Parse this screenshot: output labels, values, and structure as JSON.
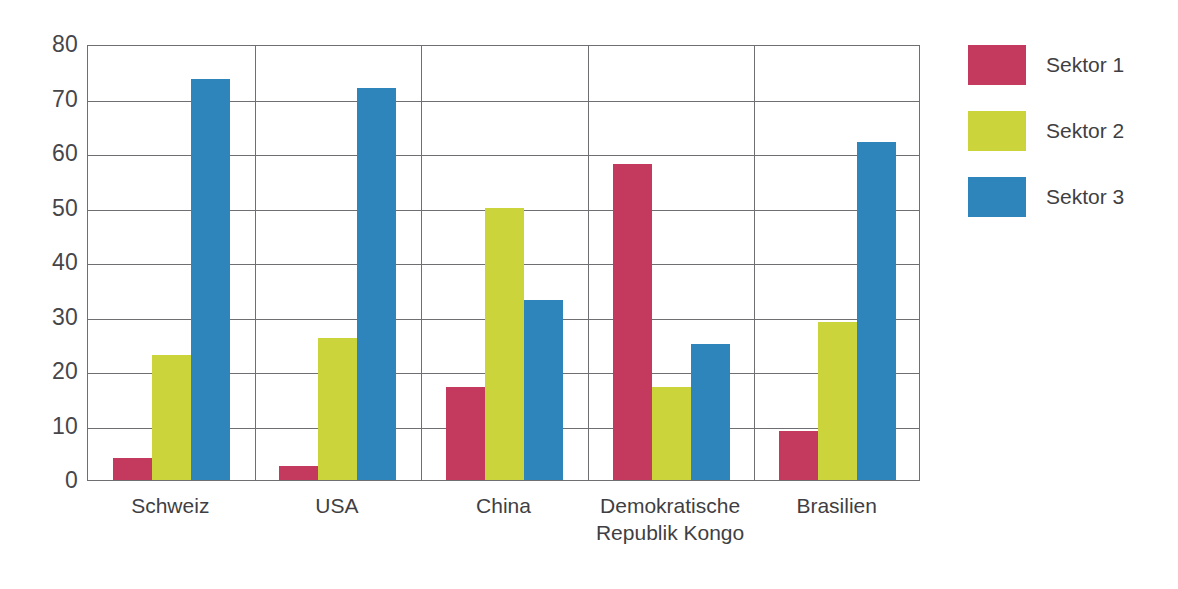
{
  "chart_data": {
    "type": "bar",
    "title": "",
    "subtitle": "",
    "xlabel": "",
    "ylabel": "",
    "ylim": [
      0,
      80
    ],
    "yticks": [
      0,
      10,
      20,
      30,
      40,
      50,
      60,
      70,
      80
    ],
    "ytick_labels": [
      "0",
      "10",
      "20",
      "30",
      "40",
      "50",
      "60",
      "70",
      "80"
    ],
    "grid": "horizontal-and-group-dividers",
    "legend_position": "right",
    "categories": [
      "Schweiz",
      "USA",
      "China",
      "Demokratische Republik Kongo",
      "Brasilien"
    ],
    "category_label_lines": [
      [
        "Schweiz"
      ],
      [
        "USA"
      ],
      [
        "China"
      ],
      [
        "Demokratische",
        "Republik Kongo"
      ],
      [
        "Brasilien"
      ]
    ],
    "series": [
      {
        "name": "Sektor 1",
        "color": "#c43a5e",
        "values": [
          4,
          2.5,
          17,
          58,
          9
        ]
      },
      {
        "name": "Sektor 2",
        "color": "#ccd43c",
        "values": [
          23,
          26,
          50,
          17,
          29
        ]
      },
      {
        "name": "Sektor 3",
        "color": "#2e85bb",
        "values": [
          73.5,
          72,
          33,
          25,
          62
        ]
      }
    ]
  },
  "legend": {
    "items": [
      {
        "label": "Sektor 1",
        "color": "#c43a5e"
      },
      {
        "label": "Sektor 2",
        "color": "#ccd43c"
      },
      {
        "label": "Sektor 3",
        "color": "#2e85bb"
      }
    ]
  },
  "axes": {
    "y_tick_labels": [
      "80",
      "70",
      "60",
      "50",
      "40",
      "30",
      "20",
      "10",
      "0"
    ],
    "x_category_labels": [
      "Schweiz",
      "USA",
      "China",
      "Demokratische Republik Kongo",
      "Brasilien"
    ]
  },
  "colors": {
    "series_1": "#c43a5e",
    "series_2": "#ccd43c",
    "series_3": "#2e85bb",
    "axis": "#6f6f73",
    "text": "#3f3f43",
    "background": "#ffffff"
  }
}
